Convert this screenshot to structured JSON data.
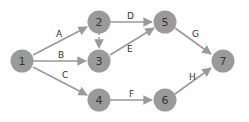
{
  "colors": {
    "node_fill": "#9a9a9a",
    "edge": "#9a9a9a",
    "label": "#333333",
    "background": "#ffffff"
  },
  "nodes": [
    {
      "id": "1",
      "label": "1",
      "x": 22,
      "y": 61
    },
    {
      "id": "2",
      "label": "2",
      "x": 99,
      "y": 22
    },
    {
      "id": "3",
      "label": "3",
      "x": 99,
      "y": 61
    },
    {
      "id": "4",
      "label": "4",
      "x": 99,
      "y": 100
    },
    {
      "id": "5",
      "label": "5",
      "x": 165,
      "y": 22
    },
    {
      "id": "6",
      "label": "6",
      "x": 165,
      "y": 100
    },
    {
      "id": "7",
      "label": "7",
      "x": 223,
      "y": 61
    }
  ],
  "edges": [
    {
      "from": "1",
      "to": "2",
      "label": "A",
      "dashed": false
    },
    {
      "from": "1",
      "to": "3",
      "label": "B",
      "dashed": false
    },
    {
      "from": "1",
      "to": "4",
      "label": "C",
      "dashed": false
    },
    {
      "from": "2",
      "to": "5",
      "label": "D",
      "dashed": false
    },
    {
      "from": "3",
      "to": "5",
      "label": "E",
      "dashed": false
    },
    {
      "from": "4",
      "to": "6",
      "label": "F",
      "dashed": false
    },
    {
      "from": "5",
      "to": "7",
      "label": "G",
      "dashed": false
    },
    {
      "from": "6",
      "to": "7",
      "label": "H",
      "dashed": false
    },
    {
      "from": "2",
      "to": "3",
      "label": "",
      "dashed": true
    }
  ]
}
